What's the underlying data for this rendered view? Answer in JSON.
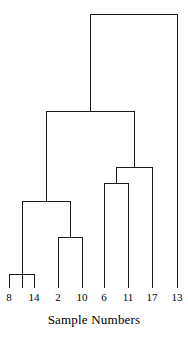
{
  "chart_data": {
    "type": "dendrogram",
    "title": "",
    "subtitle": "",
    "xlabel": "Sample Numbers",
    "ylabel": "",
    "grid": false,
    "legend": null,
    "axis_title": "Sample Numbers",
    "leaf_labels": [
      "8",
      "14",
      "2",
      "10",
      "6",
      "11",
      "17",
      "13"
    ],
    "leaf_positions": [
      9,
      34,
      58,
      82,
      104,
      128,
      152,
      177
    ],
    "leaf_baseline_y": 288,
    "plot_area": {
      "x": 0,
      "y": 10,
      "width": 188,
      "height": 278
    },
    "merges": [
      {
        "name": "merge-8-14",
        "left_x": 9,
        "right_x": 34,
        "y": 274,
        "members": [
          "8",
          "14"
        ]
      },
      {
        "name": "merge-2-10",
        "left_x": 58,
        "right_x": 82,
        "y": 237,
        "members": [
          "2",
          "10"
        ]
      },
      {
        "name": "merge-8-14-2-10",
        "left_x": 22,
        "right_x": 70,
        "y": 201,
        "members": [
          "8",
          "14",
          "2",
          "10"
        ]
      },
      {
        "name": "merge-6-11",
        "left_x": 104,
        "right_x": 128,
        "y": 183,
        "members": [
          "6",
          "11"
        ]
      },
      {
        "name": "merge-6-11-17",
        "left_x": 116,
        "right_x": 152,
        "y": 167,
        "members": [
          "6",
          "11",
          "17"
        ]
      },
      {
        "name": "merge-left-right",
        "left_x": 46,
        "right_x": 134,
        "y": 111,
        "members": [
          "8",
          "14",
          "2",
          "10",
          "6",
          "11",
          "17"
        ]
      },
      {
        "name": "merge-root",
        "left_x": 90,
        "right_x": 177,
        "y": 14,
        "members": [
          "8",
          "14",
          "2",
          "10",
          "6",
          "11",
          "17",
          "13"
        ]
      }
    ],
    "line_color": "#1a1a1a",
    "line_width": 1,
    "background_color": "#ffffff"
  },
  "axis": {
    "title": "Sample Numbers"
  },
  "labels": {
    "l0": "8",
    "l1": "14",
    "l2": "2",
    "l3": "10",
    "l4": "6",
    "l5": "11",
    "l6": "17",
    "l7": "13"
  }
}
